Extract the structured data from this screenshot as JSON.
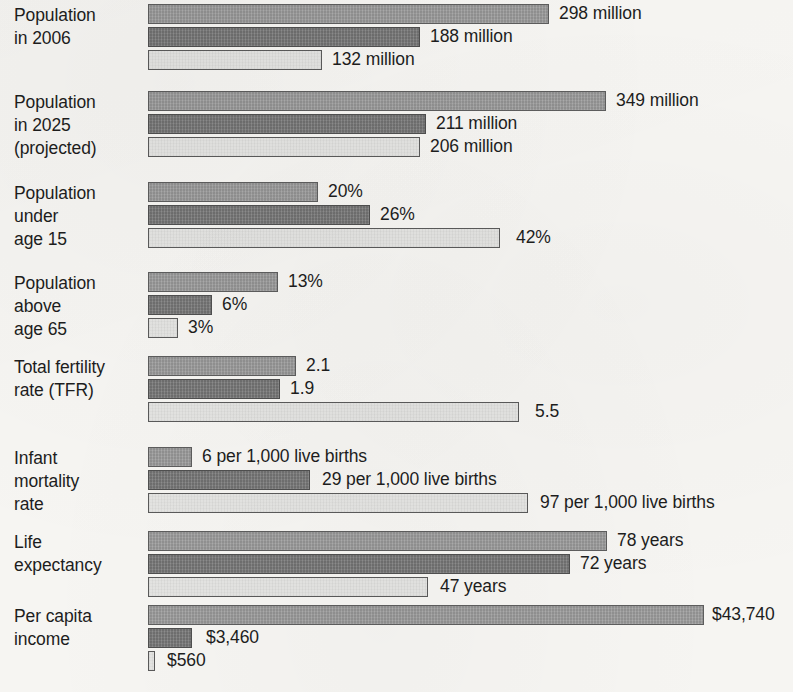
{
  "meta": {
    "bar_start_x": 148,
    "bar_height": 20,
    "palette": {
      "series_1_medium_gray": "#9b9b9b",
      "series_2_dark_gray": "#7a7a7a",
      "series_3_light_gray": "#e4e4e2",
      "bar_outline": "#5a5a5a",
      "text": "#1d1d1d",
      "page_background": "#f6f5f2"
    }
  },
  "chart_data": {
    "type": "bar",
    "orientation": "horizontal",
    "title": "",
    "subtitle": "",
    "xlabel": "",
    "ylabel": "",
    "grid": false,
    "legend_position": "none",
    "series": [
      {
        "name": "series-1",
        "shade": "medium"
      },
      {
        "name": "series-2",
        "shade": "dark"
      },
      {
        "name": "series-3",
        "shade": "light"
      }
    ],
    "categories": [
      "Population in 2006",
      "Population in 2025 (projected)",
      "Population under age 15",
      "Population above age 65",
      "Total fertility rate (TFR)",
      "Infant mortality rate",
      "Life expectancy",
      "Per capita income"
    ],
    "groups": [
      {
        "label": "Population\nin 2006",
        "top": 4,
        "bars": [
          {
            "shade": "medium",
            "value": 298,
            "unit": "million",
            "label": "298 million",
            "width": 401,
            "label_gap": 10
          },
          {
            "shade": "dark",
            "value": 188,
            "unit": "million",
            "label": "188 million",
            "width": 272,
            "label_gap": 10
          },
          {
            "shade": "light",
            "value": 132,
            "unit": "million",
            "label": "132 million",
            "width": 174,
            "label_gap": 10
          }
        ]
      },
      {
        "label": "Population\nin 2025\n(projected)",
        "top": 91,
        "bars": [
          {
            "shade": "medium",
            "value": 349,
            "unit": "million",
            "label": "349 million",
            "width": 458,
            "label_gap": 10
          },
          {
            "shade": "dark",
            "value": 211,
            "unit": "million",
            "label": "211 million",
            "width": 278,
            "label_gap": 10
          },
          {
            "shade": "light",
            "value": 206,
            "unit": "million",
            "label": "206 million",
            "width": 272,
            "label_gap": 10
          }
        ]
      },
      {
        "label": "Population\nunder\nage 15",
        "top": 182,
        "bars": [
          {
            "shade": "medium",
            "value": 20,
            "unit": "%",
            "label": "20%",
            "width": 170,
            "label_gap": 10
          },
          {
            "shade": "dark",
            "value": 26,
            "unit": "%",
            "label": "26%",
            "width": 222,
            "label_gap": 10
          },
          {
            "shade": "light",
            "value": 42,
            "unit": "%",
            "label": "42%",
            "width": 352,
            "label_gap": 16
          }
        ]
      },
      {
        "label": "Population\nabove\nage 65",
        "top": 272,
        "bars": [
          {
            "shade": "medium",
            "value": 13,
            "unit": "%",
            "label": "13%",
            "width": 130,
            "label_gap": 10
          },
          {
            "shade": "dark",
            "value": 6,
            "unit": "%",
            "label": "6%",
            "width": 64,
            "label_gap": 10
          },
          {
            "shade": "light",
            "value": 3,
            "unit": "%",
            "label": "3%",
            "width": 30,
            "label_gap": 10
          }
        ]
      },
      {
        "label": "Total fertility\nrate (TFR)",
        "top": 356,
        "bars": [
          {
            "shade": "medium",
            "value": 2.1,
            "unit": "",
            "label": "2.1",
            "width": 148,
            "label_gap": 10
          },
          {
            "shade": "dark",
            "value": 1.9,
            "unit": "",
            "label": "1.9",
            "width": 132,
            "label_gap": 10
          },
          {
            "shade": "light",
            "value": 5.5,
            "unit": "",
            "label": "5.5",
            "width": 371,
            "label_gap": 16
          }
        ]
      },
      {
        "label": "Infant\nmortality\nrate",
        "top": 447,
        "bars": [
          {
            "shade": "medium",
            "value": 6,
            "unit": "per 1,000 live births",
            "label": "6 per 1,000 live births",
            "width": 44,
            "label_gap": 10
          },
          {
            "shade": "dark",
            "value": 29,
            "unit": "per 1,000 live births",
            "label": "29 per 1,000 live births",
            "width": 162,
            "label_gap": 12
          },
          {
            "shade": "light",
            "value": 97,
            "unit": "per 1,000 live births",
            "label": "97 per 1,000 live births",
            "width": 380,
            "label_gap": 12
          }
        ]
      },
      {
        "label": "Life\nexpectancy",
        "top": 531,
        "bars": [
          {
            "shade": "medium",
            "value": 78,
            "unit": "years",
            "label": "78 years",
            "width": 459,
            "label_gap": 10
          },
          {
            "shade": "dark",
            "value": 72,
            "unit": "years",
            "label": "72 years",
            "width": 422,
            "label_gap": 10
          },
          {
            "shade": "light",
            "value": 47,
            "unit": "years",
            "label": "47 years",
            "width": 280,
            "label_gap": 12
          }
        ]
      },
      {
        "label": "Per capita\nincome",
        "top": 605,
        "bars": [
          {
            "shade": "medium",
            "value": 43740,
            "unit": "$",
            "label": "$43,740",
            "width": 556,
            "label_gap": 8
          },
          {
            "shade": "dark",
            "value": 3460,
            "unit": "$",
            "label": "$3,460",
            "width": 44,
            "label_gap": 14
          },
          {
            "shade": "light",
            "value": 560,
            "unit": "$",
            "label": "$560",
            "width": 7,
            "label_gap": 12
          }
        ]
      }
    ]
  }
}
